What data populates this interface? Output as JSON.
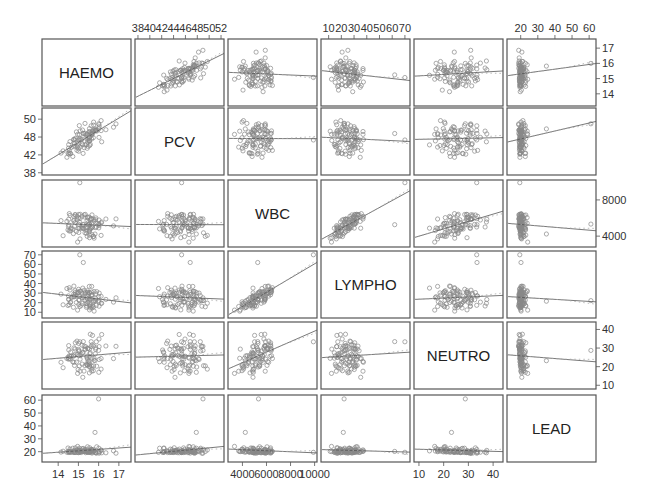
{
  "chart_data": {
    "type": "scatter",
    "title": "",
    "subtitle": "Scatterplot matrix",
    "variables": [
      "HAEMO",
      "PCV",
      "WBC",
      "LYMPHO",
      "NEUTRO",
      "LEAD"
    ],
    "ranges": {
      "HAEMO": [
        13.2,
        17.6
      ],
      "PCV": [
        37.5,
        52.5
      ],
      "WBC": [
        2800,
        10200
      ],
      "LYMPHO": [
        4,
        74
      ],
      "NEUTRO": [
        8,
        44
      ],
      "LEAD": [
        12,
        64
      ]
    },
    "axis_ticks": {
      "top": [
        {
          "variable": "PCV",
          "column": 1,
          "ticks": [
            38,
            40,
            42,
            44,
            46,
            48,
            50,
            52
          ]
        },
        {
          "variable": "LYMPHO",
          "column": 3,
          "ticks": [
            10,
            20,
            30,
            40,
            50,
            60,
            70
          ]
        },
        {
          "variable": "LEAD",
          "column": 5,
          "ticks": [
            20,
            30,
            40,
            50,
            60
          ]
        }
      ],
      "bottom": [
        {
          "variable": "HAEMO",
          "column": 0,
          "ticks": [
            14,
            15,
            16,
            17
          ]
        },
        {
          "variable": "WBC",
          "column": 2,
          "ticks": [
            4000,
            6000,
            8000,
            10000
          ]
        },
        {
          "variable": "NEUTRO",
          "column": 4,
          "ticks": [
            10,
            20,
            30,
            40
          ]
        }
      ],
      "left": [
        {
          "variable": "PCV",
          "row": 1,
          "ticks": [
            38,
            42,
            46,
            50
          ],
          "labels": [
            "38",
            "42",
            "48",
            "50"
          ]
        },
        {
          "variable": "LYMPHO",
          "row": 3,
          "ticks": [
            10,
            20,
            30,
            40,
            50,
            60,
            70
          ]
        },
        {
          "variable": "LEAD",
          "row": 5,
          "ticks": [
            20,
            30,
            40,
            50,
            60
          ]
        }
      ],
      "right": [
        {
          "variable": "HAEMO",
          "row": 0,
          "ticks": [
            14,
            15,
            16,
            17
          ]
        },
        {
          "variable": "WBC",
          "row": 2,
          "ticks": [
            4000,
            8000
          ]
        },
        {
          "variable": "NEUTRO",
          "row": 4,
          "ticks": [
            10,
            20,
            30,
            40
          ]
        }
      ]
    },
    "fit_lines": [
      {
        "x": "PCV",
        "y": "HAEMO",
        "slope": "positive-strong"
      },
      {
        "x": "WBC",
        "y": "HAEMO",
        "slope": "slight-positive"
      },
      {
        "x": "LYMPHO",
        "y": "HAEMO",
        "slope": "slight-positive"
      },
      {
        "x": "NEUTRO",
        "y": "HAEMO",
        "slope": "flat"
      },
      {
        "x": "LEAD",
        "y": "HAEMO",
        "slope": "slight-positive"
      },
      {
        "x": "WBC",
        "y": "LYMPHO",
        "slope": "positive-strong"
      },
      {
        "x": "NEUTRO",
        "y": "WBC",
        "slope": "positive"
      },
      {
        "x": "LEAD",
        "y": "NEUTRO",
        "slope": "negative"
      }
    ],
    "n_points_per_panel": 100,
    "grid": false,
    "legend": null,
    "colors": {
      "frame": "#555555",
      "points": "#888888",
      "fit": "#555555",
      "smooth": "#aaaaaa"
    }
  }
}
